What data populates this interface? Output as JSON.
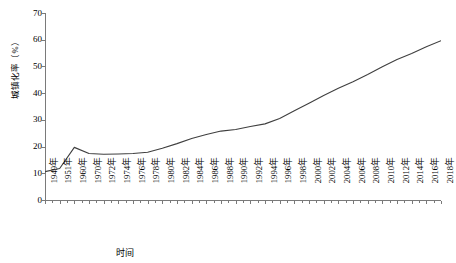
{
  "chart_data": {
    "type": "line",
    "title": "",
    "xlabel": "时间",
    "ylabel": "城镇化率（%）",
    "ylim": [
      0,
      70
    ],
    "yticks": [
      0,
      10,
      20,
      30,
      40,
      50,
      60,
      70
    ],
    "grid": false,
    "legend": false,
    "line_color": "#3f3f3f",
    "categories": [
      "1949年",
      "1951年",
      "1960年",
      "1970年",
      "1972年",
      "1974年",
      "1976年",
      "1978年",
      "1980年",
      "1982年",
      "1984年",
      "1986年",
      "1988年",
      "1990年",
      "1992年",
      "1994年",
      "1996年",
      "1998年",
      "2000年",
      "2002年",
      "2004年",
      "2006年",
      "2008年",
      "2010年",
      "2012年",
      "2014年",
      "2016年",
      "2018年"
    ],
    "values": [
      10.6,
      11.8,
      19.7,
      17.4,
      17.1,
      17.2,
      17.4,
      17.9,
      19.4,
      21.1,
      23.0,
      24.5,
      25.8,
      26.4,
      27.5,
      28.5,
      30.5,
      33.4,
      36.2,
      39.1,
      41.8,
      44.3,
      47.0,
      49.9,
      52.6,
      54.8,
      57.4,
      59.6
    ],
    "n_xticks": 28,
    "series": [
      {
        "name": "城镇化率",
        "values": [
          10.6,
          11.8,
          19.7,
          17.4,
          17.1,
          17.2,
          17.4,
          17.9,
          19.4,
          21.1,
          23.0,
          24.5,
          25.8,
          26.4,
          27.5,
          28.5,
          30.5,
          33.4,
          36.2,
          39.1,
          41.8,
          44.3,
          47.0,
          49.9,
          52.6,
          54.8,
          57.4,
          59.6
        ]
      }
    ]
  }
}
